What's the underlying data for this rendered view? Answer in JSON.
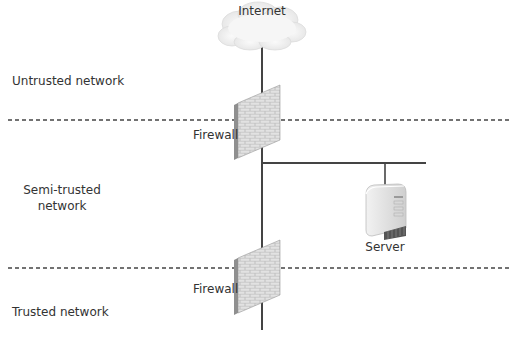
{
  "diagram": {
    "type": "network-zones",
    "nodes": {
      "internet": {
        "label": "Internet",
        "icon": "cloud-icon"
      },
      "firewall_outer": {
        "label": "Firewall",
        "icon": "brick-wall-icon"
      },
      "firewall_inner": {
        "label": "Firewall",
        "icon": "brick-wall-icon"
      },
      "server": {
        "label": "Server",
        "icon": "server-tower-icon"
      }
    },
    "zones": [
      {
        "label": "Untrusted network"
      },
      {
        "label": "Semi-trusted network",
        "line1": "Semi-trusted",
        "line2": "network"
      },
      {
        "label": "Trusted network"
      }
    ],
    "edges": [
      {
        "from": "internet",
        "to": "firewall_outer"
      },
      {
        "from": "firewall_outer",
        "to": "firewall_inner"
      },
      {
        "from": "firewall_outer",
        "to": "server"
      },
      {
        "from": "firewall_inner",
        "to": "trusted network"
      }
    ],
    "colors": {
      "line": "#444444",
      "dashed_boundary": "#444444",
      "cloud": "#eeeeee",
      "brick": "#b8b8b8",
      "server": "#e6e6e6"
    }
  }
}
